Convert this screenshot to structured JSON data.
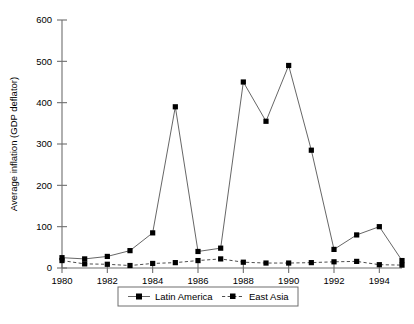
{
  "chart_data": {
    "type": "line",
    "title": "",
    "xlabel": "",
    "ylabel": "Average inflation (GDP deflator)",
    "xlim": [
      1980,
      1995
    ],
    "ylim": [
      0,
      600
    ],
    "grid": false,
    "legend_position": "bottom-center",
    "x": [
      1980,
      1981,
      1982,
      1983,
      1984,
      1985,
      1986,
      1987,
      1988,
      1989,
      1990,
      1991,
      1992,
      1993,
      1994,
      1995
    ],
    "x_tick_labels": [
      "1980",
      "1982",
      "1984",
      "1986",
      "1988",
      "1990",
      "1992",
      "1994"
    ],
    "x_tick_values": [
      1980,
      1982,
      1984,
      1986,
      1988,
      1990,
      1992,
      1994
    ],
    "y_tick_labels": [
      "0",
      "100",
      "200",
      "300",
      "400",
      "500",
      "600"
    ],
    "y_tick_values": [
      0,
      100,
      200,
      300,
      400,
      500,
      600
    ],
    "series": [
      {
        "name": "Latin America",
        "line_style": "solid",
        "marker": "square",
        "color": "#555555",
        "values": [
          25,
          22,
          28,
          42,
          85,
          390,
          40,
          48,
          450,
          355,
          490,
          285,
          45,
          80,
          100,
          18
        ]
      },
      {
        "name": "East Asia",
        "line_style": "dashed",
        "marker": "square",
        "color": "#3a3a3a",
        "values": [
          18,
          10,
          9,
          6,
          11,
          13,
          18,
          22,
          14,
          12,
          12,
          13,
          15,
          16,
          8,
          7
        ]
      }
    ]
  },
  "legend": {
    "items": [
      {
        "label": "Latin America",
        "style": "solid"
      },
      {
        "label": "East Asia",
        "style": "dashed"
      }
    ]
  }
}
